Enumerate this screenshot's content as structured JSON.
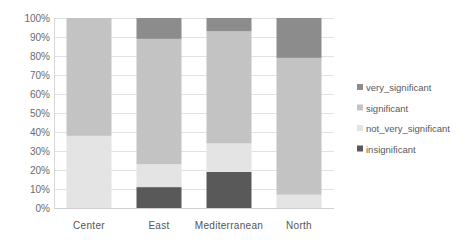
{
  "chart_data": {
    "type": "bar",
    "stacked": true,
    "percent_stacked": true,
    "title": "",
    "xlabel": "",
    "ylabel": "",
    "ylim": [
      0,
      100
    ],
    "y_ticks": [
      "0%",
      "10%",
      "20%",
      "30%",
      "40%",
      "50%",
      "60%",
      "70%",
      "80%",
      "90%",
      "100%"
    ],
    "grid": true,
    "legend_position": "right",
    "categories": [
      "Center",
      "East",
      "Mediterranean",
      "North"
    ],
    "series": [
      {
        "name": "insignificant",
        "color": "#595959",
        "values": [
          0,
          11,
          19,
          0
        ]
      },
      {
        "name": "not_very_significant",
        "color": "#e4e4e4",
        "values": [
          38,
          12,
          15,
          7
        ]
      },
      {
        "name": "significant",
        "color": "#c3c3c3",
        "values": [
          62,
          66,
          59,
          72
        ]
      },
      {
        "name": "very_significant",
        "color": "#8c8c8c",
        "values": [
          0,
          11,
          7,
          21
        ]
      }
    ],
    "legend_order": [
      "very_significant",
      "significant",
      "not_very_significant",
      "insignificant"
    ]
  }
}
